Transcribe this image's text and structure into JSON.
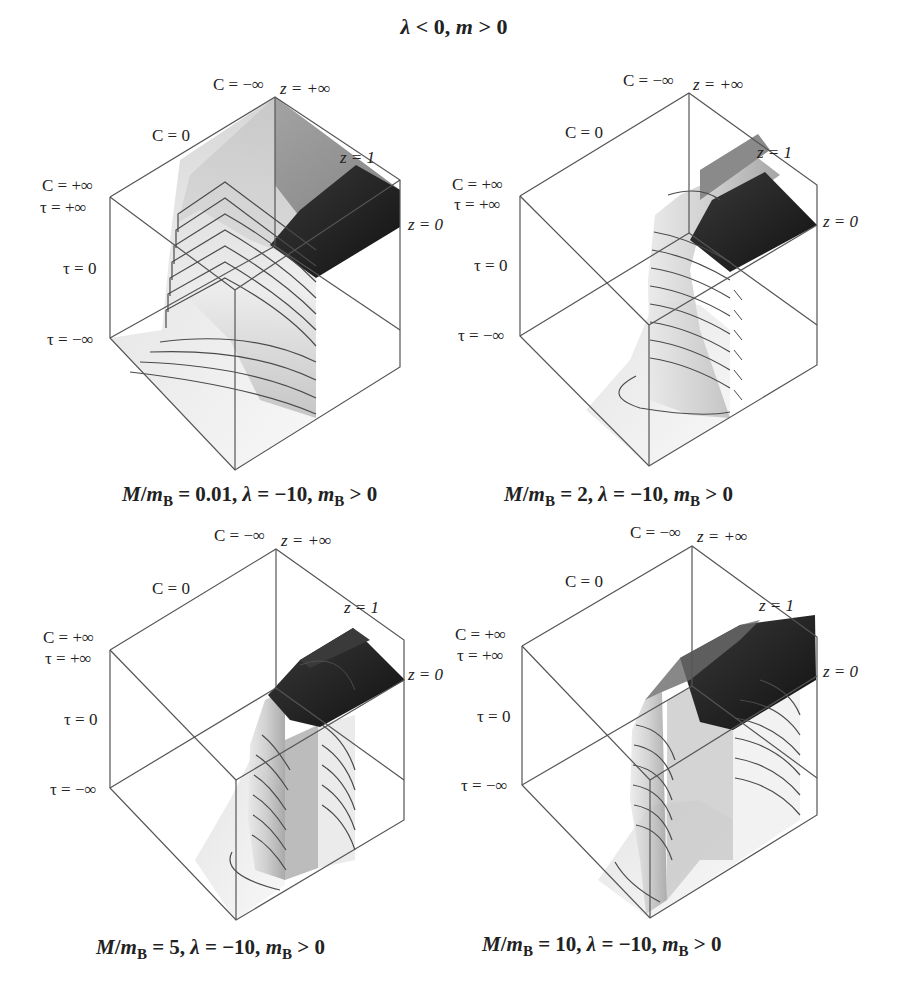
{
  "figure": {
    "title": "λ < 0, m > 0",
    "title_parts": {
      "lambda": "λ",
      "lt0": " < 0, ",
      "m": "m",
      "gt0": " > 0"
    }
  },
  "axis_labels": {
    "c_neg_inf": "C = −∞",
    "z_pos_inf": "z = +∞",
    "c_zero": "C = 0",
    "z_one": "z = 1",
    "c_pos_inf": "C = +∞",
    "tau_pos_inf": "τ = +∞",
    "z_zero": "z = 0",
    "tau_zero": "τ = 0",
    "tau_neg_inf": "τ = −∞"
  },
  "panels": [
    {
      "id": "top-left",
      "ratio": "0.01",
      "caption": {
        "m": "M",
        "slash": "/",
        "mb": "m",
        "sub": "B",
        "eq": " = 0.01, ",
        "lam": "λ",
        "lamv": " = −10, ",
        "mb2": "m",
        "sub2": "B",
        "tail": " > 0"
      }
    },
    {
      "id": "top-right",
      "ratio": "2",
      "caption": {
        "m": "M",
        "slash": "/",
        "mb": "m",
        "sub": "B",
        "eq": " = 2, ",
        "lam": "λ",
        "lamv": " = −10, ",
        "mb2": "m",
        "sub2": "B",
        "tail": " > 0"
      }
    },
    {
      "id": "bottom-left",
      "ratio": "5",
      "caption": {
        "m": "M",
        "slash": "/",
        "mb": "m",
        "sub": "B",
        "eq": " = 5, ",
        "lam": "λ",
        "lamv": " = −10, ",
        "mb2": "m",
        "sub2": "B",
        "tail": " > 0"
      }
    },
    {
      "id": "bottom-right",
      "ratio": "10",
      "caption": {
        "m": "M",
        "slash": "/",
        "mb": "m",
        "sub": "B",
        "eq": " = 10, ",
        "lam": "λ",
        "lamv": " = −10, ",
        "mb2": "m",
        "sub2": "B",
        "tail": " > 0"
      }
    }
  ],
  "colors": {
    "edge": "#555555",
    "surface_dark": "#1e1e1e",
    "surface_mid": "#7a7a7a",
    "surface_light": "#e4e4e4",
    "contour": "#4a4a4a"
  }
}
